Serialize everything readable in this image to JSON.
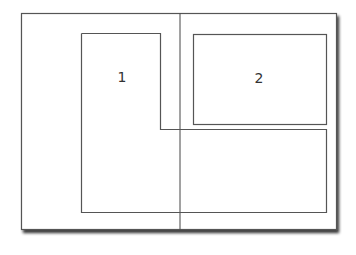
{
  "diagram": {
    "type": "layout-regions",
    "colors": {
      "stroke": "#555555",
      "shadow": "#666666",
      "background": "#ffffff",
      "label": "#333333"
    },
    "regions": [
      {
        "id": "region-1",
        "label": "1",
        "shape": "L-shape"
      },
      {
        "id": "region-2",
        "label": "2",
        "shape": "rectangle"
      }
    ]
  }
}
